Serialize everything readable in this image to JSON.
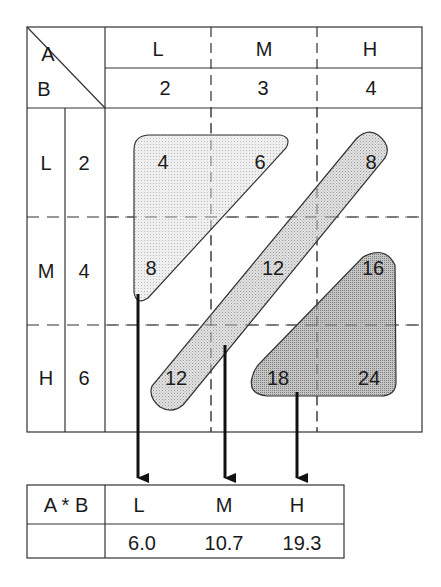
{
  "corner": {
    "col_factor": "A",
    "row_factor": "B"
  },
  "columns": [
    {
      "level": "L",
      "value": "2"
    },
    {
      "level": "M",
      "value": "3"
    },
    {
      "level": "H",
      "value": "4"
    }
  ],
  "rows": [
    {
      "level": "L",
      "value": "2"
    },
    {
      "level": "M",
      "value": "4"
    },
    {
      "level": "H",
      "value": "6"
    }
  ],
  "cells": [
    [
      "4",
      "6",
      "8"
    ],
    [
      "8",
      "12",
      "16"
    ],
    [
      "12",
      "18",
      "24"
    ]
  ],
  "groups": [
    {
      "name": "L",
      "members": [
        "4",
        "6",
        "8"
      ],
      "fill": "#e8e8e8"
    },
    {
      "name": "M",
      "members": [
        "8",
        "12",
        "12"
      ],
      "fill": "#d9d9d9"
    },
    {
      "name": "H",
      "members": [
        "16",
        "18",
        "24"
      ],
      "fill": "#b8b8b8"
    }
  ],
  "result_table": {
    "header_label": "A * B",
    "levels": [
      "L",
      "M",
      "H"
    ],
    "means": [
      "6.0",
      "10.7",
      "19.3"
    ]
  },
  "colors": {
    "line": "#333333",
    "arrow": "#111111"
  }
}
